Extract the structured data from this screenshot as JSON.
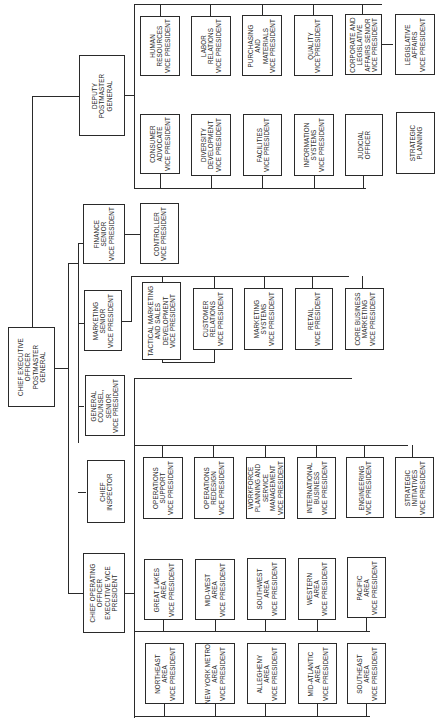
{
  "chart_title": "",
  "orientation": "rotated-90-ccw",
  "root": {
    "label": "CHIEF EXECUTIVE\nOFFICER\nPOSTMASTER\nGENERAL"
  },
  "direct_reports": {
    "deputy": {
      "label": "DEPUTY\nPOSTMASTER\nGENERAL"
    },
    "finance": {
      "label": "FINANCE\nSENIOR\nVICE PRESIDENT"
    },
    "marketing": {
      "label": "MARKETING\nSENIOR\nVICE PRESIDENT"
    },
    "counsel": {
      "label": "GENERAL\nCOUNSEL,\nSENIOR\nVICE PRESIDENT"
    },
    "inspector": {
      "label": "CHIEF\nINSPECTOR"
    },
    "coo": {
      "label": "CHIEF OPERATING\nOFFICER\nEXECUTIVE VICE\nPRESIDENT"
    }
  },
  "deputy_reports": {
    "row_top": [
      {
        "label": "HUMAN\nRESOURCES\nVICE PRESIDENT"
      },
      {
        "label": "LABOR\nRELATIONS\nVICE PRESIDENT"
      },
      {
        "label": "PURCHASING\nAND\nMATERIALS\nVICE PRESIDENT"
      },
      {
        "label": "QUALITY\nVICE PRESIDENT"
      },
      {
        "label": "CORPORATE AND\nLEGISLATIVE\nAFFAIRS SENIOR\nVICE PRESIDENT"
      }
    ],
    "legislative": {
      "label": "LEGISLATIVE\nAFFAIRS\nVICE PRESIDENT"
    },
    "row_bottom": [
      {
        "label": "CONSUMER\nADVOCATE\nVICE PRESIDENT"
      },
      {
        "label": "DIVERSITY\nDEVELOPMENT\nVICE PRESIDENT"
      },
      {
        "label": "FACILITIES\nVICE PRESIDENT"
      },
      {
        "label": "INFORMATION\nSYSTEMS\nVICE PRESIDENT"
      },
      {
        "label": "JUDICIAL\nOFFICER"
      },
      {
        "label": "STRATEGIC\nPLANNING"
      }
    ]
  },
  "finance_reports": [
    {
      "label": "CONTROLLER\nVICE PRESIDENT"
    }
  ],
  "marketing_reports": [
    {
      "label": "TACTICAL MARKETING\nAND SALES\nDEVELOPMENT\nVICE PRESIDENT"
    },
    {
      "label": "CUSTOMER\nRELATIONS\nVICE PRESIDENT"
    },
    {
      "label": "MARKETING\nSYSTEMS\nVICE PRESIDENT"
    },
    {
      "label": "RETAIL\nVICE PRESIDENT"
    },
    {
      "label": "CORE BUSINESS\nMARKETING\nVICE PRESIDENT"
    }
  ],
  "coo_reports": {
    "operations": [
      {
        "label": "OPERATIONS\nSUPPORT\nVICE PRESIDENT"
      },
      {
        "label": "OPERATIONS\nREDESIGN\nVICE PRESIDENT"
      },
      {
        "label": "WORKFORCE\nPLANNING AND\nSERVICE\nMANAGEMENT\nVICE PRESIDENT"
      },
      {
        "label": "INTERNATIONAL\nBUSINESS\nVICE PRESIDENT"
      },
      {
        "label": "ENGINEERING\nVICE PRESIDENT"
      },
      {
        "label": "STRATEGIC\nINITIATIVES\nVICE PRESIDENT"
      }
    ],
    "areas_row1": [
      {
        "label": "GREAT LAKES\nAREA\nVICE PRESIDENT"
      },
      {
        "label": "MID-WEST\nAREA\nVICE PRESIDENT"
      },
      {
        "label": "SOUTHWEST\nAREA\nVICE PRESIDENT"
      },
      {
        "label": "WESTERN\nAREA\nVICE PRESIDENT"
      },
      {
        "label": "PACIFIC\nAREA\nVICE PRESIDENT"
      }
    ],
    "areas_row2": [
      {
        "label": "NORTHEAST\nAREA\nVICE PRESIDENT"
      },
      {
        "label": "NEW YORK METRO\nAREA\nVICE PRESIDENT"
      },
      {
        "label": "ALLEGHENY\nAREA\nVICE PRESIDENT"
      },
      {
        "label": "MID-ATLANTIC\nAREA\nVICE PRESIDENT"
      },
      {
        "label": "SOUTHEAST\nAREA\nVICE PRESIDENT"
      }
    ]
  }
}
